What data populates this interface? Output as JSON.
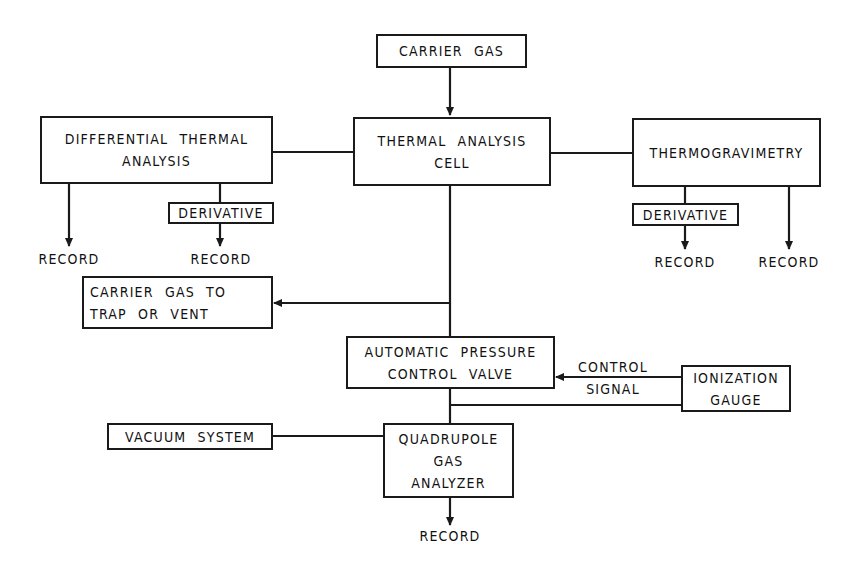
{
  "diagram": {
    "nodes": {
      "carrier_gas": {
        "lines": [
          "CARRIER GAS"
        ]
      },
      "dta": {
        "lines": [
          "DIFFERENTIAL THERMAL",
          "ANALYSIS"
        ]
      },
      "thermal_cell": {
        "lines": [
          "THERMAL ANALYSIS",
          "CELL"
        ]
      },
      "tg": {
        "lines": [
          "THERMOGRAVIMETRY"
        ]
      },
      "dta_derivative": {
        "lines": [
          "DERIVATIVE"
        ]
      },
      "tg_derivative": {
        "lines": [
          "DERIVATIVE"
        ]
      },
      "trap_vent": {
        "lines": [
          "CARRIER GAS TO",
          "TRAP OR VENT"
        ]
      },
      "pressure_valve": {
        "lines": [
          "AUTOMATIC PRESSURE",
          "CONTROL VALVE"
        ]
      },
      "ion_gauge": {
        "lines": [
          "IONIZATION",
          "GAUGE"
        ]
      },
      "vacuum": {
        "lines": [
          "VACUUM SYSTEM"
        ]
      },
      "quadrupole": {
        "lines": [
          "QUADRUPOLE",
          "GAS",
          "ANALYZER"
        ]
      }
    },
    "labels": {
      "record_dta": "RECORD",
      "record_dta_deriv": "RECORD",
      "record_tg_deriv": "RECORD",
      "record_tg": "RECORD",
      "record_qga": "RECORD",
      "control_signal_1": "CONTROL",
      "control_signal_2": "SIGNAL"
    },
    "colors": {
      "line": "#1a1a1a",
      "background": "#ffffff"
    }
  }
}
